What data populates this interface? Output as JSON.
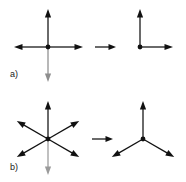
{
  "figure": {
    "width": 186,
    "height": 182,
    "background_color": "#ffffff",
    "stroke_color": "#111111",
    "faded_stroke_color": "#9a9a9a",
    "panels": [
      {
        "id": "a",
        "label": "a)",
        "label_x": 10,
        "label_y": 70,
        "left_figure": {
          "name": "four-arrow-cross",
          "center": [
            48,
            47
          ],
          "dot_radius": 2.4,
          "arrows": [
            {
              "name": "arrow-up",
              "angle_deg": 90,
              "length": 38,
              "color": "#111111"
            },
            {
              "name": "arrow-right",
              "angle_deg": 0,
              "length": 35,
              "color": "#111111"
            },
            {
              "name": "arrow-down",
              "angle_deg": 270,
              "length": 35,
              "color": "#8e8e8e"
            },
            {
              "name": "arrow-left",
              "angle_deg": 180,
              "length": 34,
              "color": "#111111"
            }
          ]
        },
        "implication": {
          "name": "implication-arrow",
          "x1": 95,
          "y1": 47,
          "x2": 116,
          "y2": 47,
          "color": "#111111"
        },
        "right_figure": {
          "name": "l-shape-two-arrows",
          "center": [
            140,
            47
          ],
          "dot_radius": 2.4,
          "arrows": [
            {
              "name": "arrow-up",
              "angle_deg": 90,
              "length": 38,
              "color": "#111111"
            },
            {
              "name": "arrow-right",
              "angle_deg": 0,
              "length": 33,
              "color": "#111111"
            }
          ]
        }
      },
      {
        "id": "b",
        "label": "b)",
        "label_x": 10,
        "label_y": 163,
        "left_figure": {
          "name": "six-arrow-star",
          "center": [
            48,
            139
          ],
          "dot_radius": 2.4,
          "arrows": [
            {
              "name": "arrow-up",
              "angle_deg": 90,
              "length": 38,
              "color": "#111111"
            },
            {
              "name": "arrow-upper-right",
              "angle_deg": 30,
              "length": 36,
              "color": "#111111"
            },
            {
              "name": "arrow-lower-right",
              "angle_deg": -30,
              "length": 36,
              "color": "#111111"
            },
            {
              "name": "arrow-down",
              "angle_deg": 270,
              "length": 36,
              "color": "#9a9a9a"
            },
            {
              "name": "arrow-lower-left",
              "angle_deg": 210,
              "length": 36,
              "color": "#111111"
            },
            {
              "name": "arrow-upper-left",
              "angle_deg": 150,
              "length": 36,
              "color": "#111111"
            }
          ]
        },
        "implication": {
          "name": "implication-arrow",
          "x1": 92,
          "y1": 139,
          "x2": 113,
          "y2": 139,
          "color": "#111111"
        },
        "right_figure": {
          "name": "three-arrow-y-shape",
          "center": [
            143,
            139
          ],
          "dot_radius": 2.4,
          "arrows": [
            {
              "name": "arrow-up",
              "angle_deg": 90,
              "length": 38,
              "color": "#111111"
            },
            {
              "name": "arrow-lower-right",
              "angle_deg": -30,
              "length": 36,
              "color": "#111111"
            },
            {
              "name": "arrow-lower-left",
              "angle_deg": 210,
              "length": 36,
              "color": "#111111"
            }
          ]
        }
      }
    ]
  }
}
